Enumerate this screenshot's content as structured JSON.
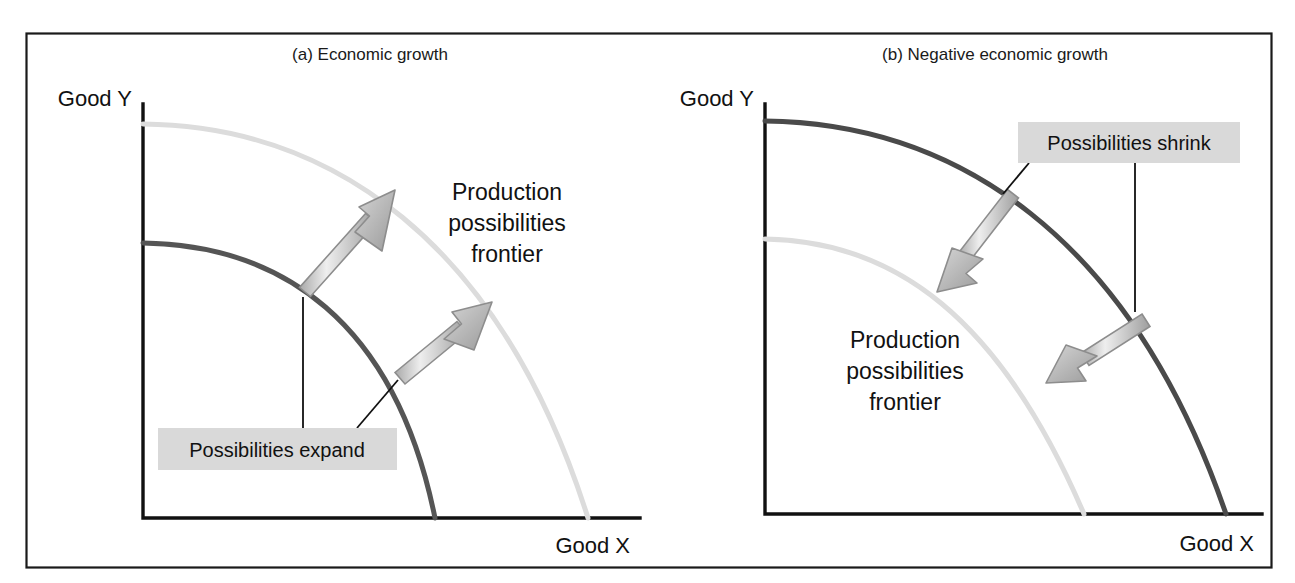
{
  "figure": {
    "outer_frame": {
      "x": 26,
      "y": 33,
      "w": 1246,
      "h": 535
    },
    "background": "#ffffff",
    "frame_color": "#1a1a1a",
    "dark_curve_color": "#4a4a4a",
    "light_curve_color": "#d8d8d8",
    "arrow_fill": "#c9c9c9",
    "arrow_edge": "#8f8f8f",
    "tag_bg": "#d9d9d9",
    "leader_color": "#111111",
    "axis_color": "#111111"
  },
  "panels": [
    {
      "id": "a",
      "title": "(a) Economic growth",
      "title_x": 370,
      "title_y": 60,
      "axis": {
        "origin_x": 143,
        "origin_y": 518,
        "top_y": 104,
        "right_x": 640
      },
      "y_axis_label": "Good Y",
      "y_axis_label_x": 132,
      "y_axis_label_y": 106,
      "x_axis_label": "Good X",
      "x_axis_label_x": 630,
      "x_axis_label_y": 553,
      "frontier_label": {
        "lines": [
          "Production",
          "possibilities",
          "frontier"
        ],
        "x": 507,
        "y": 200
      },
      "tag": {
        "text": "Possibilities expand",
        "box": {
          "x": 158,
          "y": 428,
          "w": 239,
          "h": 42
        },
        "text_x": 277,
        "text_y": 456
      },
      "curves": {
        "inner": {
          "x0": 143,
          "y0": 243,
          "x1": 435,
          "y1": 518,
          "note": "original frontier (dark)"
        },
        "outer": {
          "x0": 143,
          "y0": 124,
          "x1": 588,
          "y1": 518,
          "note": "expanded frontier (light)"
        }
      },
      "arrows": [
        {
          "name": "upper-expansion-arrow",
          "tail_x": 305,
          "tail_y": 292,
          "tip_x": 395,
          "tip_y": 190,
          "direction": "outward"
        },
        {
          "name": "lower-expansion-arrow",
          "tail_x": 400,
          "tail_y": 378,
          "tip_x": 492,
          "tip_y": 302,
          "direction": "outward"
        }
      ],
      "leaders": [
        {
          "name": "tag-leader-vertical",
          "x1": 303,
          "y1": 428,
          "x2": 303,
          "y2": 297
        },
        {
          "name": "tag-leader-diagonal",
          "x1": 357,
          "y1": 428,
          "x2": 397,
          "y2": 381
        }
      ]
    },
    {
      "id": "b",
      "title": "(b) Negative economic growth",
      "title_x": 995,
      "title_y": 60,
      "axis": {
        "origin_x": 765,
        "origin_y": 514,
        "top_y": 104,
        "right_x": 1262
      },
      "y_axis_label": "Good Y",
      "y_axis_label_x": 754,
      "y_axis_label_y": 106,
      "x_axis_label": "Good X",
      "x_axis_label_x": 1254,
      "x_axis_label_y": 551,
      "frontier_label": {
        "lines": [
          "Production",
          "possibilities",
          "frontier"
        ],
        "x": 905,
        "y": 348
      },
      "tag": {
        "text": "Possibilities shrink",
        "box": {
          "x": 1018,
          "y": 122,
          "w": 222,
          "h": 41
        },
        "text_x": 1129,
        "text_y": 149
      },
      "curves": {
        "outer": {
          "x0": 765,
          "y0": 121,
          "x1": 1226,
          "y1": 514,
          "note": "original frontier (dark)"
        },
        "inner": {
          "x0": 765,
          "y0": 239,
          "x1": 1084,
          "y1": 514,
          "note": "shrunken frontier (light)"
        }
      },
      "arrows": [
        {
          "name": "upper-shrink-arrow",
          "tail_x": 1013,
          "tail_y": 194,
          "tip_x": 937,
          "tip_y": 292,
          "direction": "inward"
        },
        {
          "name": "lower-shrink-arrow",
          "tail_x": 1146,
          "tail_y": 320,
          "tip_x": 1046,
          "tip_y": 383,
          "direction": "inward"
        }
      ],
      "leaders": [
        {
          "name": "tag-leader-diagonal",
          "x1": 1029,
          "y1": 163,
          "x2": 1003,
          "y2": 193
        },
        {
          "name": "tag-leader-vertical",
          "x1": 1135,
          "y1": 163,
          "x2": 1135,
          "y2": 312
        }
      ]
    }
  ]
}
